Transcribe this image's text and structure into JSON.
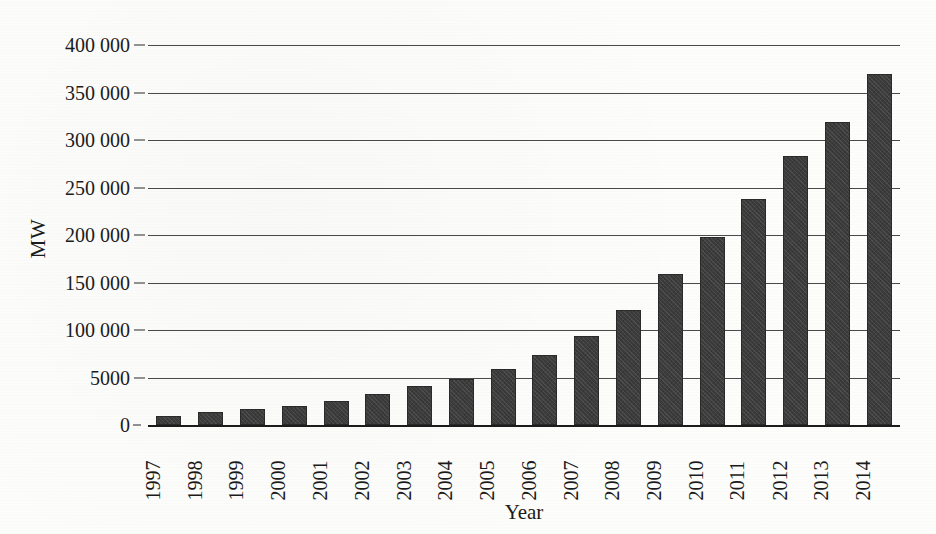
{
  "chart_data": {
    "type": "bar",
    "title": "",
    "xlabel": "Year",
    "ylabel": "MW",
    "categories": [
      "1997",
      "1998",
      "1999",
      "2000",
      "2001",
      "2002",
      "2003",
      "2004",
      "2005",
      "2006",
      "2007",
      "2008",
      "2009",
      "2010",
      "2011",
      "2012",
      "2013",
      "2014"
    ],
    "values": [
      10000,
      14000,
      17000,
      20000,
      25000,
      33000,
      41000,
      48000,
      59000,
      74000,
      94000,
      121000,
      159000,
      198000,
      238000,
      283000,
      319000,
      370000
    ],
    "ylim": [
      0,
      400000
    ],
    "y_ticks": [
      0,
      50000,
      100000,
      150000,
      200000,
      250000,
      300000,
      350000,
      400000
    ],
    "y_tick_labels": [
      "0",
      "5000",
      "100 000",
      "150 000",
      "200 000",
      "250 000",
      "300 000",
      "350 000",
      "400 000"
    ],
    "grid": true,
    "legend": "none",
    "bar_color": "#3c3c3c",
    "axis_color": "#1c1c1c",
    "gridline_color": "#4a4a4a",
    "background_color": "#fdfdfc"
  },
  "axes": {
    "y_title": "MW",
    "x_title": "Year"
  }
}
